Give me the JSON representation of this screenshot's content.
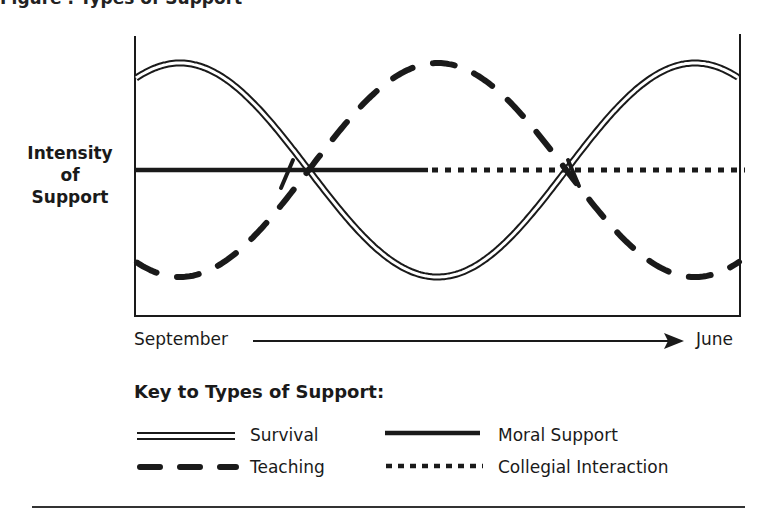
{
  "figure": {
    "title_partial": "Figure . Types of Support"
  },
  "chart_data": {
    "type": "line",
    "title": "Types of Support",
    "xlabel": "September → June",
    "ylabel": "Intensity of Support",
    "x_start_label": "September",
    "x_end_label": "June",
    "grid": false,
    "legend_position": "bottom",
    "legend_title": "Key to Types of Support:",
    "x": [
      0,
      0.1,
      0.2,
      0.3,
      0.4,
      0.5,
      0.6,
      0.7,
      0.8,
      0.9,
      1.0
    ],
    "series": [
      {
        "name": "Survival",
        "style": "double-line",
        "values": [
          0.78,
          0.96,
          0.75,
          0.2,
          -0.45,
          -0.96,
          -0.55,
          0.25,
          0.86,
          0.94,
          0.7
        ]
      },
      {
        "name": "Teaching",
        "style": "dashed",
        "values": [
          -0.78,
          -0.96,
          -0.75,
          -0.2,
          0.45,
          0.96,
          0.55,
          -0.25,
          -0.86,
          -0.94,
          -0.7
        ]
      },
      {
        "name": "Moral Support",
        "style": "solid",
        "values": [
          0,
          0,
          0,
          0,
          0,
          0,
          null,
          null,
          null,
          null,
          null
        ]
      },
      {
        "name": "Collegial Interaction",
        "style": "dotted",
        "values": [
          null,
          null,
          null,
          null,
          null,
          0,
          0,
          0,
          0,
          0,
          0
        ]
      }
    ],
    "annotations": [
      "Survival and Teaching cross the Moral Support line near early term",
      "Survival and Teaching cross the Collegial Interaction line near spring"
    ]
  },
  "axis": {
    "ylabel_lines": [
      "Intensity",
      "of",
      "Support"
    ],
    "start": "September",
    "end": "June"
  },
  "legend": {
    "title": "Key to Types of Support:",
    "items": [
      {
        "label": "Survival",
        "style": "double"
      },
      {
        "label": "Moral Support",
        "style": "solid"
      },
      {
        "label": "Teaching",
        "style": "dashed"
      },
      {
        "label": "Collegial Interaction",
        "style": "dotted"
      }
    ]
  },
  "colors": {
    "ink": "#1a1a1a",
    "background": "#ffffff"
  }
}
